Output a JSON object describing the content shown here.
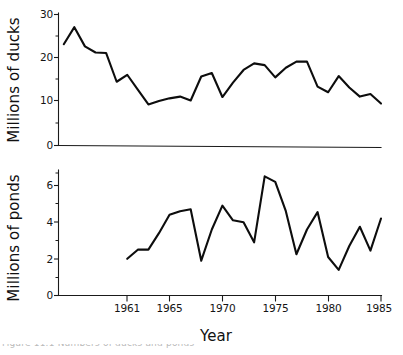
{
  "figure": {
    "xlabel": "Year",
    "caption_partial": "Figure 11.1 Numbers of ducks and ponds"
  },
  "chart_data": [
    {
      "type": "line",
      "title": "",
      "xlabel": "Year",
      "ylabel": "Millions of ducks",
      "xlim": [
        1954.5,
        1985
      ],
      "ylim": [
        0,
        30
      ],
      "yticks": [
        0,
        10,
        20,
        30
      ],
      "ytick_labels": [
        "0",
        "10",
        "20",
        "30"
      ],
      "xticks": [
        1961,
        1965,
        1970,
        1975,
        1980,
        1985
      ],
      "xtick_labels": [
        "1961",
        "1965",
        "1970",
        "1975",
        "1980",
        "1985"
      ],
      "grid": false,
      "legend": "none",
      "x": [
        1955,
        1956,
        1957,
        1958,
        1959,
        1960,
        1961,
        1962,
        1963,
        1964,
        1965,
        1966,
        1967,
        1968,
        1969,
        1970,
        1971,
        1972,
        1973,
        1974,
        1975,
        1976,
        1977,
        1978,
        1979,
        1980,
        1981,
        1982,
        1983,
        1984,
        1985
      ],
      "values": [
        23.2,
        27.1,
        22.7,
        21.3,
        21.2,
        14.6,
        16.2,
        12.8,
        9.4,
        10.2,
        10.8,
        11.2,
        10.3,
        15.8,
        16.6,
        11.1,
        14.4,
        17.3,
        18.8,
        18.4,
        15.6,
        17.8,
        19.2,
        19.2,
        13.5,
        12.2,
        15.9,
        13.3,
        11.2,
        11.8,
        9.6
      ]
    },
    {
      "type": "line",
      "title": "",
      "xlabel": "Year",
      "ylabel": "Millions of ponds",
      "xlim": [
        1954.5,
        1985
      ],
      "ylim": [
        0,
        7
      ],
      "yticks": [
        0,
        2,
        4,
        6
      ],
      "ytick_labels": [
        "0",
        "2",
        "4",
        "6"
      ],
      "yticks_minor": [
        1,
        3,
        5,
        7
      ],
      "xticks": [
        1961,
        1965,
        1970,
        1975,
        1980,
        1985
      ],
      "xtick_labels": [
        "1961",
        "1965",
        "1970",
        "1975",
        "1980",
        "1985"
      ],
      "grid": false,
      "legend": "none",
      "x": [
        1961,
        1962,
        1963,
        1964,
        1965,
        1966,
        1967,
        1968,
        1969,
        1970,
        1971,
        1972,
        1973,
        1974,
        1975,
        1976,
        1977,
        1978,
        1979,
        1980,
        1981,
        1982,
        1983,
        1984,
        1985
      ],
      "values": [
        2.0,
        2.5,
        2.5,
        3.4,
        4.4,
        4.6,
        4.7,
        1.9,
        3.6,
        4.9,
        4.1,
        4.0,
        2.9,
        6.5,
        6.2,
        4.6,
        2.25,
        3.6,
        4.55,
        2.1,
        1.4,
        2.7,
        3.75,
        2.45,
        4.2
      ]
    }
  ]
}
